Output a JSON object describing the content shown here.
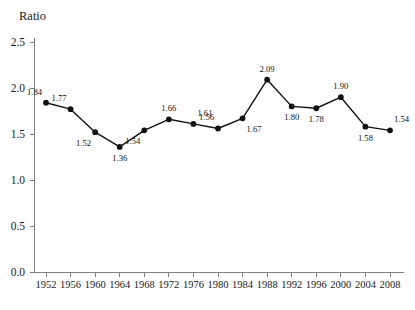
{
  "chart_data": {
    "type": "line",
    "title": "",
    "ylabel": "Ratio",
    "xlabel": "",
    "grid": false,
    "legend": "none",
    "ylim": [
      0.0,
      2.5
    ],
    "ytick_labels": [
      "2.5",
      "2.0",
      "1.5",
      "1.0",
      "0.5",
      "0.0"
    ],
    "ytick_values": [
      2.5,
      2.0,
      1.5,
      1.0,
      0.5,
      0.0
    ],
    "categories": [
      "1952",
      "1956",
      "1960",
      "1964",
      "1968",
      "1972",
      "1976",
      "1980",
      "1984",
      "1988",
      "1992",
      "1996",
      "2000",
      "2004",
      "2008"
    ],
    "x": [
      1952,
      1956,
      1960,
      1964,
      1968,
      1972,
      1976,
      1980,
      1984,
      1988,
      1992,
      1996,
      2000,
      2004,
      2008
    ],
    "values": [
      1.84,
      1.77,
      1.52,
      1.36,
      1.54,
      1.66,
      1.61,
      1.56,
      1.67,
      2.09,
      1.8,
      1.78,
      1.9,
      1.58,
      1.54
    ],
    "data_labels": [
      "1.84",
      "1.77",
      "1.52",
      "1.36",
      "1.54",
      "1.66",
      "1.61",
      "1.56",
      "1.67",
      "2.09",
      "1.80",
      "1.78",
      "1.90",
      "1.58",
      "1.54"
    ],
    "label_positions": [
      "above-left",
      "above-left",
      "below-left",
      "below",
      "below-left",
      "above",
      "above-right",
      "above-left",
      "below-right",
      "above",
      "below",
      "below",
      "above",
      "below",
      "above-right"
    ],
    "series": [
      {
        "name": "Ratio",
        "values": [
          1.84,
          1.77,
          1.52,
          1.36,
          1.54,
          1.66,
          1.61,
          1.56,
          1.67,
          2.09,
          1.8,
          1.78,
          1.9,
          1.58,
          1.54
        ],
        "color": "#111111",
        "marker": "circle"
      }
    ],
    "axis_color": "#808080"
  }
}
